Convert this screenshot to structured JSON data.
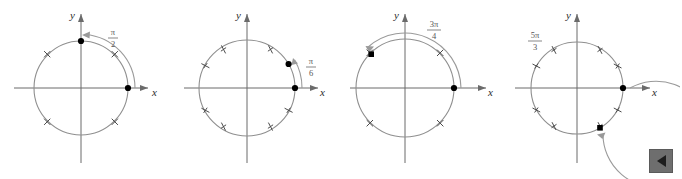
{
  "figure": {
    "background_color": "#ffffff",
    "axis_color": "#6b6b6b",
    "circle_color": "#8f8f8f",
    "arc_color": "#9a9a9a",
    "point_color": "#000000",
    "label_color": "#555555",
    "panels": [
      {
        "id": "panel-1",
        "angle_label": "π/2",
        "angle_numerator": "π",
        "angle_denominator": "2",
        "angle_degrees": 90,
        "direction": "counterclockwise",
        "terminal_point_degrees": 90,
        "initial_point_degrees": 0,
        "tick_count": 4,
        "tick_degrees": [
          45,
          135,
          225,
          315
        ],
        "x_axis_label": "x",
        "y_axis_label": "y"
      },
      {
        "id": "panel-2",
        "angle_label": "π/6",
        "angle_numerator": "π",
        "angle_denominator": "6",
        "angle_degrees": 30,
        "direction": "counterclockwise",
        "terminal_point_degrees": 30,
        "initial_point_degrees": 0,
        "tick_count": 8,
        "tick_degrees": [
          60,
          120,
          150,
          210,
          240,
          300,
          330,
          30
        ],
        "x_axis_label": "x",
        "y_axis_label": "y"
      },
      {
        "id": "panel-3",
        "angle_label": "3π/4",
        "angle_numerator": "3π",
        "angle_denominator": "4",
        "angle_degrees": 135,
        "direction": "counterclockwise",
        "terminal_point_degrees": 135,
        "initial_point_degrees": 0,
        "tick_count": 4,
        "tick_degrees": [
          45,
          135,
          225,
          315
        ],
        "x_axis_label": "x",
        "y_axis_label": "y"
      },
      {
        "id": "panel-4",
        "angle_label": "5π/3",
        "angle_numerator": "5π",
        "angle_denominator": "3",
        "angle_degrees": 300,
        "direction": "clockwise",
        "terminal_point_degrees": 300,
        "initial_point_degrees": 0,
        "tick_count": 8,
        "tick_degrees": [
          30,
          60,
          120,
          150,
          210,
          240,
          300,
          330
        ],
        "x_axis_label": "x",
        "y_axis_label": "y"
      }
    ]
  },
  "nav": {
    "back_button_label": "◀",
    "back_button_name": "previous-page"
  }
}
